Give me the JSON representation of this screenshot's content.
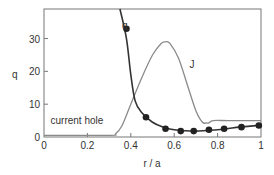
{
  "chart_data": {
    "type": "line",
    "title": "",
    "xlabel": "r / a",
    "ylabel": "q",
    "xlim": [
      0,
      1
    ],
    "ylim": [
      0,
      39
    ],
    "grid": false,
    "x_ticks": [
      "0",
      "0.2",
      "0.4",
      "0.6",
      "0.8",
      "1"
    ],
    "y_ticks": [
      "0",
      "10",
      "20",
      "30"
    ],
    "annotations": [
      {
        "text": "q",
        "x": 0.36,
        "y": 33
      },
      {
        "text": "J",
        "x": 0.67,
        "y": 21
      },
      {
        "text": "current hole",
        "x": 0.03,
        "y": 4
      }
    ],
    "series": [
      {
        "name": "q",
        "style": "line with markers",
        "color": "#333333",
        "x": [
          0.35,
          0.38,
          0.4,
          0.42,
          0.45,
          0.5,
          0.55,
          0.6,
          0.65,
          0.7,
          0.75,
          0.8,
          0.85,
          0.9,
          0.95,
          1.0
        ],
        "values": [
          39,
          30,
          19,
          11,
          7.5,
          4.5,
          3,
          2.2,
          1.9,
          1.8,
          2.0,
          2.2,
          2.6,
          3.0,
          3.3,
          3.7
        ],
        "markers": {
          "x": [
            0.38,
            0.47,
            0.56,
            0.63,
            0.69,
            0.76,
            0.83,
            0.91,
            0.99
          ],
          "values": [
            33,
            6,
            2.5,
            1.8,
            1.8,
            2.2,
            2.5,
            3.0,
            3.5
          ]
        }
      },
      {
        "name": "J",
        "style": "line",
        "color": "#8a8a8a",
        "x": [
          0.0,
          0.3,
          0.33,
          0.36,
          0.4,
          0.45,
          0.5,
          0.54,
          0.56,
          0.58,
          0.62,
          0.66,
          0.7,
          0.73,
          0.75,
          0.76,
          0.78,
          0.85,
          1.0
        ],
        "values": [
          0.5,
          0.5,
          1.0,
          3.5,
          10,
          18,
          25,
          28.5,
          29,
          28.5,
          24,
          16,
          8,
          4.5,
          4.3,
          4.3,
          5,
          5,
          5
        ]
      }
    ]
  }
}
